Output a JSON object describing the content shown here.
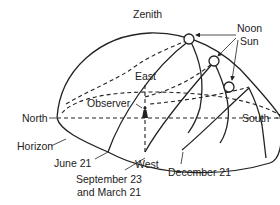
{
  "diagram": {
    "labels": {
      "zenith": "Zenith",
      "noon_sun_line1": "Noon",
      "noon_sun_line2": "Sun",
      "east": "East",
      "observer": "Observer",
      "north": "North",
      "south": "South",
      "west": "West",
      "horizon": "Horizon",
      "june": "June 21",
      "equinox_line1": "September 23",
      "equinox_line2": "and March 21",
      "december": "December 21"
    },
    "sun_paths": [
      {
        "name": "June 21"
      },
      {
        "name": "September 23 and March 21"
      },
      {
        "name": "December 21"
      }
    ]
  }
}
